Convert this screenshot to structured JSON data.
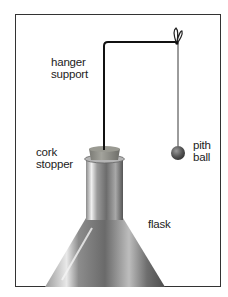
{
  "diagram": {
    "labels": {
      "hanger_support": [
        "hanger",
        "support"
      ],
      "cork_stopper": [
        "cork",
        "stopper"
      ],
      "pith_ball": [
        "pith",
        "ball"
      ],
      "flask": "flask"
    },
    "colors": {
      "frame": "#333333",
      "wire": "#111111",
      "thread": "#222222",
      "cork": "#8a8a84",
      "glass_dark": "#5a5a5a",
      "glass_light": "#e8e8e8",
      "pith_ball": "#555555",
      "text": "#222222"
    }
  }
}
